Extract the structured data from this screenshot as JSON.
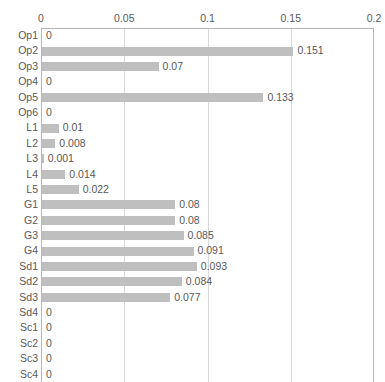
{
  "chart_data": {
    "type": "bar",
    "orientation": "horizontal",
    "title": "",
    "subtitle": "",
    "xlabel": "",
    "ylabel": "",
    "xlim": [
      0,
      0.2
    ],
    "ylim": null,
    "grid": true,
    "legend": null,
    "legend_position": "none",
    "xticks": [
      "0",
      "0.05",
      "0.1",
      "0.15",
      "0.2"
    ],
    "xtick_values": [
      0,
      0.05,
      0.1,
      0.15,
      0.2
    ],
    "bar_color": "#bfbfbf",
    "gridline_color": "#d9d9d9",
    "axis_color": "#b5b5b5",
    "text_color": "#595959",
    "categories": [
      "Op1",
      "Op2",
      "Op3",
      "Op4",
      "Op5",
      "Op6",
      "L1",
      "L2",
      "L3",
      "L4",
      "L5",
      "G1",
      "G2",
      "G3",
      "G4",
      "Sd1",
      "Sd2",
      "Sd3",
      "Sd4",
      "Sc1",
      "Sc2",
      "Sc3",
      "Sc4"
    ],
    "values": [
      0,
      0.151,
      0.07,
      0,
      0.133,
      0,
      0.01,
      0.008,
      0.001,
      0.014,
      0.022,
      0.08,
      0.08,
      0.085,
      0.091,
      0.093,
      0.084,
      0.077,
      0,
      0,
      0,
      0,
      0
    ],
    "data_labels": [
      "0",
      "0.151",
      "0.07",
      "0",
      "0.133",
      "0",
      "0.01",
      "0.008",
      "0.001",
      "0.014",
      "0.022",
      "0.08",
      "0.08",
      "0.085",
      "0.091",
      "0.093",
      "0.084",
      "0.077",
      "0",
      "0",
      "0",
      "0",
      "0"
    ]
  }
}
